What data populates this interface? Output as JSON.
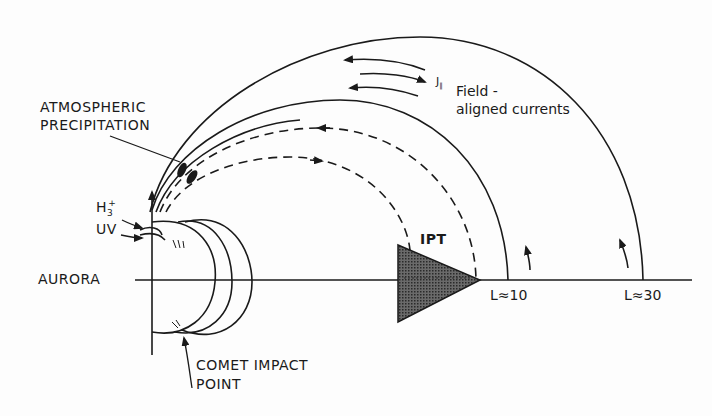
{
  "diagram": {
    "labels": {
      "atmospheric_precipitation_line1": "ATMOSPHERIC",
      "atmospheric_precipitation_line2": "PRECIPITATION",
      "h3_plus": "H",
      "h3_sub": "3",
      "h3_sup": "+",
      "uv": "UV",
      "aurora": "AURORA",
      "comet_impact_line1": "COMET IMPACT",
      "comet_impact_line2": "POINT",
      "ipt": "IPT",
      "l10": "L≈10",
      "l30": "L≈30",
      "field_aligned_line1": "Field -",
      "field_aligned_line2": "aligned currents",
      "j_parallel": "J",
      "j_parallel_sub": "∥"
    },
    "colors": {
      "ink": "#1a1a1a",
      "background": "#fdfdfd",
      "ipt_fill": "#555555"
    }
  }
}
